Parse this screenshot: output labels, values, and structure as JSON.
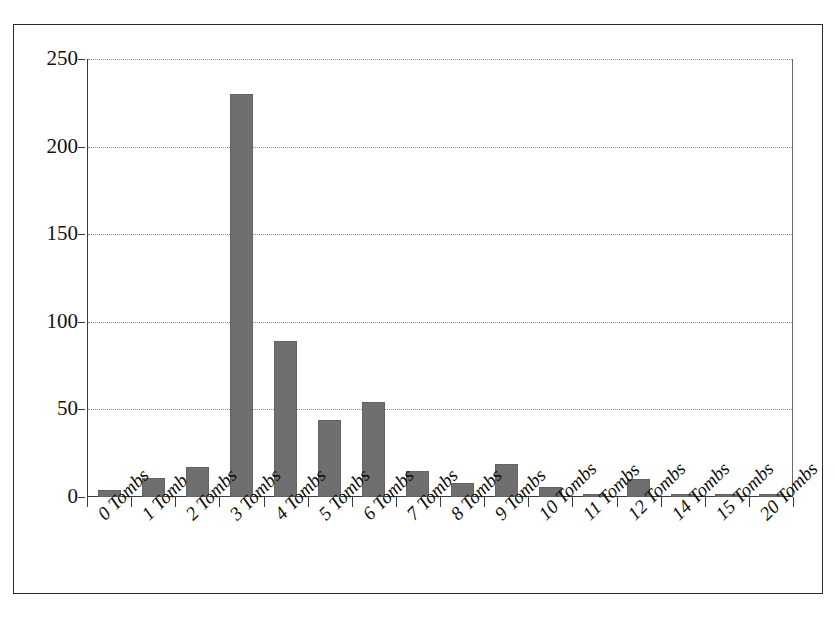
{
  "chart_data": {
    "type": "bar",
    "title": "",
    "subtitle": "",
    "xlabel": "",
    "ylabel": "",
    "categories": [
      "0 Tombs",
      "1 Tomb",
      "2 Tombs",
      "3 Tombs",
      "4 Tombs",
      "5 Tombs",
      "6 Tombs",
      "7 Tombs",
      "8 Tombs",
      "9 Tombs",
      "10 Tombs",
      "11 Tombs",
      "12 Tombs",
      "14 Tombs",
      "15 Tombs",
      "20 Tombs"
    ],
    "values": [
      4,
      11,
      17,
      230,
      89,
      44,
      54,
      15,
      8,
      19,
      6,
      2,
      10,
      2,
      2,
      2
    ],
    "ylim": [
      0,
      250
    ],
    "yticks": [
      0,
      50,
      100,
      150,
      200,
      250
    ],
    "ytick_labels": [
      "0",
      "50",
      "100",
      "150",
      "200",
      "250"
    ],
    "grid": true,
    "grid_axis": "y",
    "grid_style": "dotted",
    "legend": false,
    "legend_position": "none",
    "bar_color": "#6f6f6f",
    "axis_color": "#3a3a3a",
    "gridline_color": "#8d8d8d",
    "background_color": "#ffffff",
    "xtick_label_rotation": -45,
    "series": [
      {
        "name": "Count",
        "values": [
          4,
          11,
          17,
          230,
          89,
          44,
          54,
          15,
          8,
          19,
          6,
          2,
          10,
          2,
          2,
          2
        ]
      }
    ]
  }
}
